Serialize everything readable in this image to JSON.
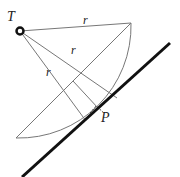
{
  "diagram": {
    "labels": {
      "point_T": "T",
      "point_P": "P",
      "radius_top": "r",
      "radius_middle": "r",
      "radius_lower": "r"
    },
    "colors": {
      "thin_line": "#777777",
      "thick_line": "#111111",
      "point": "#111111"
    }
  }
}
